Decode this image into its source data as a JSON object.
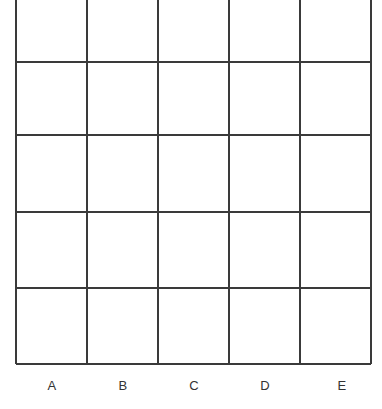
{
  "figure": {
    "kind": "grid-chart",
    "background_color": "#ffffff",
    "width": 382,
    "height": 409
  },
  "chart_data": {
    "type": "table",
    "title": "",
    "subtitle": "",
    "xlabel": "",
    "ylabel": "",
    "grid": true,
    "legend": null,
    "annotations": [],
    "columns": 5,
    "rows": 5,
    "categories": [
      "A",
      "B",
      "C",
      "D",
      "E"
    ],
    "tick_labels_x": [
      "A",
      "B",
      "C",
      "D",
      "E"
    ],
    "tick_labels_y": [],
    "values": [
      [
        "",
        "",
        "",
        "",
        ""
      ],
      [
        "",
        "",
        "",
        "",
        ""
      ],
      [
        "",
        "",
        "",
        "",
        ""
      ],
      [
        "",
        "",
        "",
        "",
        ""
      ],
      [
        "",
        "",
        "",
        "",
        ""
      ]
    ],
    "series": [],
    "line_color": "#3a3a3a",
    "line_width": 1.5,
    "cell_fill": "#ffffff",
    "label_color": "#333333",
    "label_font_size": 13,
    "geometry": {
      "x_lines": [
        16,
        87,
        158,
        229,
        300,
        371
      ],
      "y_lines": [
        -10,
        62,
        135,
        212,
        288,
        364
      ],
      "column_centers": [
        52,
        123,
        194,
        265,
        342
      ],
      "row_centers": [
        26,
        98,
        173,
        250,
        326
      ],
      "label_baseline_y": 385,
      "top_row_clipped": true
    }
  },
  "labels": {
    "columns": [
      {
        "id": "a",
        "text": "A",
        "x": 52,
        "y": 385
      },
      {
        "id": "b",
        "text": "B",
        "x": 123,
        "y": 385
      },
      {
        "id": "c",
        "text": "C",
        "x": 194,
        "y": 385
      },
      {
        "id": "d",
        "text": "D",
        "x": 265,
        "y": 385
      },
      {
        "id": "e",
        "text": "E",
        "x": 342,
        "y": 385
      }
    ]
  }
}
